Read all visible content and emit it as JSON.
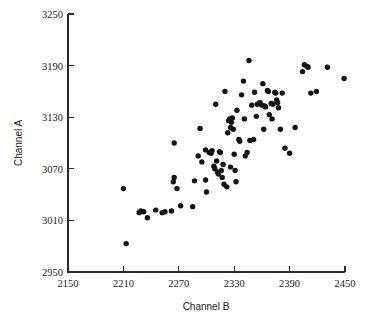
{
  "chart_data": {
    "type": "scatter",
    "title": "",
    "xlabel": "Channel B",
    "ylabel": "Channel A",
    "xlim": [
      2150,
      2450
    ],
    "ylim": [
      2950,
      3250
    ],
    "xticks": [
      2150,
      2210,
      2270,
      2330,
      2390,
      2450
    ],
    "yticks": [
      2950,
      3010,
      3070,
      3130,
      3190,
      3250
    ],
    "grid": false,
    "legend": null,
    "marker": "filled-circle",
    "marker_color": "#141414",
    "points": [
      [
        2210,
        3047
      ],
      [
        2213,
        2983
      ],
      [
        2227,
        3019
      ],
      [
        2229,
        3021
      ],
      [
        2232,
        3020
      ],
      [
        2236,
        3013
      ],
      [
        2245,
        3022
      ],
      [
        2252,
        3019
      ],
      [
        2255,
        3020
      ],
      [
        2262,
        3021
      ],
      [
        2264,
        3055
      ],
      [
        2265,
        3060
      ],
      [
        2265,
        3100
      ],
      [
        2268,
        3047
      ],
      [
        2272,
        3027
      ],
      [
        2285,
        3026
      ],
      [
        2287,
        3056
      ],
      [
        2291,
        3085
      ],
      [
        2293,
        3117
      ],
      [
        2295,
        3078
      ],
      [
        2299,
        3092
      ],
      [
        2299,
        3057
      ],
      [
        2300,
        3043
      ],
      [
        2303,
        3089
      ],
      [
        2305,
        3088
      ],
      [
        2306,
        3091
      ],
      [
        2308,
        3073
      ],
      [
        2309,
        3070
      ],
      [
        2310,
        3145
      ],
      [
        2311,
        3079
      ],
      [
        2312,
        3066
      ],
      [
        2313,
        3064
      ],
      [
        2314,
        3090
      ],
      [
        2315,
        3089
      ],
      [
        2316,
        3068
      ],
      [
        2317,
        3060
      ],
      [
        2318,
        3075
      ],
      [
        2319,
        3052
      ],
      [
        2320,
        3160
      ],
      [
        2322,
        3049
      ],
      [
        2323,
        3112
      ],
      [
        2324,
        3126
      ],
      [
        2325,
        3128
      ],
      [
        2326,
        3118
      ],
      [
        2326,
        3072
      ],
      [
        2327,
        3124
      ],
      [
        2328,
        3129
      ],
      [
        2329,
        3116
      ],
      [
        2330,
        3087
      ],
      [
        2331,
        3068
      ],
      [
        2332,
        3055
      ],
      [
        2333,
        3138
      ],
      [
        2335,
        3104
      ],
      [
        2336,
        3102
      ],
      [
        2338,
        3156
      ],
      [
        2340,
        3172
      ],
      [
        2341,
        3128
      ],
      [
        2342,
        3085
      ],
      [
        2344,
        3089
      ],
      [
        2346,
        3196
      ],
      [
        2347,
        3103
      ],
      [
        2349,
        3144
      ],
      [
        2351,
        3104
      ],
      [
        2352,
        3159
      ],
      [
        2354,
        3131
      ],
      [
        2355,
        3145
      ],
      [
        2357,
        3146
      ],
      [
        2358,
        3147
      ],
      [
        2360,
        3144
      ],
      [
        2361,
        3169
      ],
      [
        2362,
        3116
      ],
      [
        2363,
        3143
      ],
      [
        2364,
        3142
      ],
      [
        2366,
        3161
      ],
      [
        2367,
        3160
      ],
      [
        2368,
        3133
      ],
      [
        2370,
        3146
      ],
      [
        2371,
        3128
      ],
      [
        2372,
        3145
      ],
      [
        2374,
        3159
      ],
      [
        2375,
        3158
      ],
      [
        2376,
        3150
      ],
      [
        2377,
        3147
      ],
      [
        2378,
        3141
      ],
      [
        2380,
        3116
      ],
      [
        2382,
        3158
      ],
      [
        2385,
        3094
      ],
      [
        2390,
        3088
      ],
      [
        2396,
        3118
      ],
      [
        2404,
        3183
      ],
      [
        2406,
        3191
      ],
      [
        2409,
        3189
      ],
      [
        2410,
        3188
      ],
      [
        2413,
        3158
      ],
      [
        2419,
        3160
      ],
      [
        2431,
        3188
      ],
      [
        2449,
        3175
      ]
    ]
  },
  "axes": {
    "x_title": "Channel B",
    "y_title": "Channel A",
    "x_tick_labels": [
      "2150",
      "2210",
      "2270",
      "2330",
      "2390",
      "2450"
    ],
    "y_tick_labels": [
      "2950",
      "3010",
      "3070",
      "3130",
      "3190",
      "3250"
    ]
  }
}
